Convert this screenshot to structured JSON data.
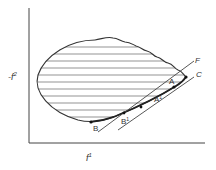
{
  "diagram": {
    "axes": {
      "y_label": "-f",
      "y_label_sup": "2",
      "x_label": "f",
      "x_label_sup": "1"
    },
    "lines": [
      {
        "name": "F",
        "label": "F"
      },
      {
        "name": "C",
        "label": "C"
      }
    ],
    "points": [
      {
        "name": "A",
        "label": "A"
      },
      {
        "name": "A1",
        "label": "A",
        "sup": "1"
      },
      {
        "name": "B",
        "label": "B"
      },
      {
        "name": "B1",
        "label": "B",
        "sup": "1"
      }
    ],
    "colors": {
      "stroke": "#333333",
      "hatch": "#555555",
      "background": "#ffffff"
    }
  }
}
